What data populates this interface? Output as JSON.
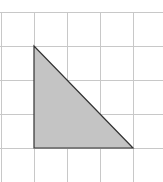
{
  "diagram": {
    "type": "grid-with-shape",
    "grid": {
      "origin_x": 1,
      "origin_y": 12,
      "cell_size": 33,
      "columns_visible": 5,
      "rows_visible": 5,
      "line_color": "#c8c8c8"
    },
    "shape": {
      "name": "right-triangle",
      "vertices_grid_units": [
        [
          1,
          1
        ],
        [
          1,
          4
        ],
        [
          4,
          4
        ]
      ],
      "legs": {
        "vertical_units": 3,
        "horizontal_units": 3
      },
      "fill_color": "#c4c4c4",
      "stroke_color": "#333333"
    }
  }
}
